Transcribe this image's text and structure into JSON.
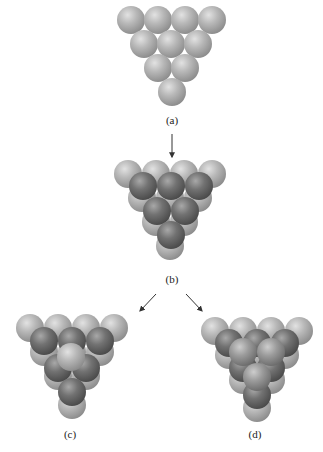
{
  "figure": {
    "colors": {
      "layer_a": "#b4b4b4",
      "layer_b": "#6e6e6e",
      "layer_c": "#a0a0a0",
      "arrow": "#333333",
      "background": "#ffffff"
    },
    "panels": [
      {
        "id": "a",
        "label": "(a)"
      },
      {
        "id": "b",
        "label": "(b)"
      },
      {
        "id": "c",
        "label": "(c)"
      },
      {
        "id": "d",
        "label": "(d)"
      }
    ]
  }
}
